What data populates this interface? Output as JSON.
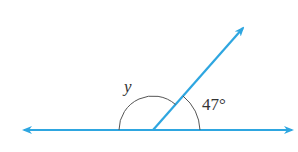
{
  "diagram": {
    "type": "angle-on-straight-line",
    "line_color": "#2ea6e0",
    "arc_color": "#555555",
    "labels": {
      "unknown_angle": "y",
      "known_angle": "47°"
    },
    "elements": [
      {
        "kind": "line",
        "description": "horizontal straight line with arrows on both ends"
      },
      {
        "kind": "ray",
        "description": "ray from vertex on line toward upper right, arrow at end"
      },
      {
        "kind": "arc",
        "label": "y",
        "description": "obtuse angle between left part of line and ray"
      },
      {
        "kind": "arc",
        "label": "47°",
        "description": "acute angle between ray and right part of line"
      }
    ]
  }
}
